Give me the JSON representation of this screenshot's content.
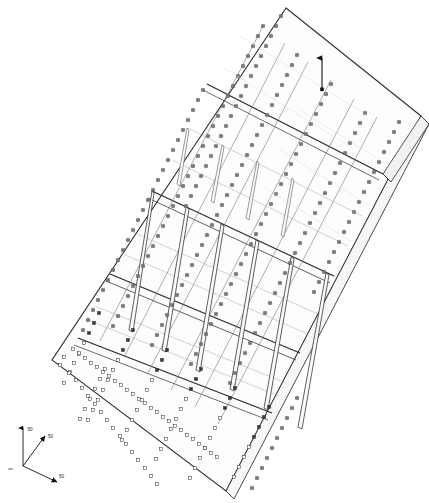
{
  "drawing": {
    "type": "isometric-cad-view",
    "title": "",
    "background_color": "#ffffff",
    "line_color": "#2b2b2b",
    "fill_color": "#fdfdfd",
    "rivet_color": "#6e6e6e",
    "hole_color": "#ffffff",
    "hole_stroke": "#2b2b2b",
    "description": "Isometric wireframe of a riveted perforated panel assembly with longitudinal stringers, transverse frame members and vertical divider fins"
  },
  "axis_triad": {
    "name": "coordinate-triad",
    "origin_label": "om",
    "axes": [
      {
        "id": "z",
        "label": "50",
        "direction": "up"
      },
      {
        "id": "y",
        "label": "50",
        "direction": "up-right"
      },
      {
        "id": "x",
        "label": "50",
        "direction": "down-right"
      }
    ]
  },
  "annotations": {
    "leader_arrow": {
      "name": "dimension-leader-arrow",
      "label": ""
    }
  },
  "geometry": {
    "panel_corners": {
      "top": "286,8",
      "right": "421,116",
      "bottom": "226,491",
      "left": "52,360"
    },
    "stringer_count": 6,
    "frame_count": 4,
    "divider_fin_count": 7
  }
}
